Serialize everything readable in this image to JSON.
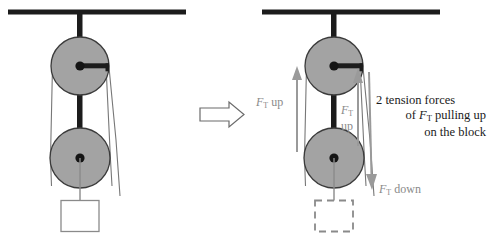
{
  "diagram": {
    "transition_icon": "right-arrow-icon",
    "colors": {
      "pulley_fill": "#a3a3a3",
      "pulley_stroke": "#3b3b3b",
      "rod": "#1c1c1c",
      "ceiling": "#1c1c1c",
      "rope": "#6e6e6e",
      "arrow": "#8f8f8f",
      "block_stroke": "#8a8a8a",
      "text": "#1a1a1a",
      "label_text": "#8a8a8a"
    },
    "left_figure": {
      "name": "pulley-system-plain",
      "ceiling": "support-ceiling",
      "upper_pulley": "upper-pulley",
      "lower_pulley": "lower-pulley",
      "block": "hanging-block",
      "block_style": "solid"
    },
    "right_figure": {
      "name": "pulley-system-annotated",
      "ceiling": "support-ceiling",
      "upper_pulley": "upper-pulley",
      "lower_pulley": "lower-pulley",
      "block": "hanging-block",
      "block_style": "dashed"
    },
    "labels": {
      "ft_up_left": {
        "symbol": "F",
        "subscript": "T",
        "suffix": " up"
      },
      "ft_up_middle": {
        "symbol": "F",
        "subscript": "T",
        "suffix": "up"
      },
      "ft_down": {
        "symbol": "F",
        "subscript": "T",
        "suffix": " down"
      }
    },
    "note": {
      "line1": "2  tension forces",
      "line2_pre": "of ",
      "line2_symbol": "F",
      "line2_subscript": "T",
      "line2_post": " pulling up",
      "line3": "on the block"
    }
  }
}
